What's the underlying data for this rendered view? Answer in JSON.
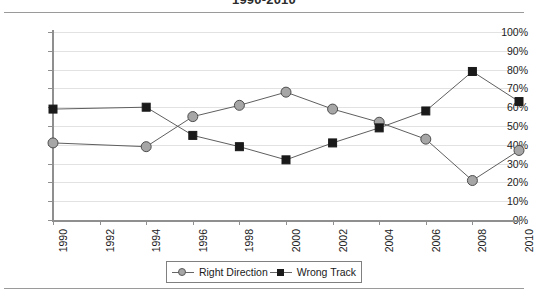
{
  "title": "1990-2010",
  "legend": {
    "position": "bottom-center",
    "entries": [
      {
        "label": "Right Direction",
        "marker": "circle-gray",
        "color": "#a6a6a6"
      },
      {
        "label": "Wrong Track",
        "marker": "square-black",
        "color": "#1a1a1a"
      }
    ]
  },
  "axes": {
    "y_ticks": [
      "0%",
      "10%",
      "20%",
      "30%",
      "40%",
      "50%",
      "60%",
      "70%",
      "80%",
      "90%",
      "100%"
    ],
    "x_ticks": [
      "1990",
      "1992",
      "1994",
      "1996",
      "1998",
      "2000",
      "2002",
      "2004",
      "2006",
      "2008",
      "2010"
    ]
  },
  "chart_data": {
    "type": "line",
    "title": "1990-2010",
    "xlabel": "",
    "ylabel": "",
    "ylim": [
      0,
      100
    ],
    "ytick_step": 10,
    "grid": true,
    "legend_position": "bottom-center",
    "x": [
      1990,
      1992,
      1994,
      1996,
      1998,
      2000,
      2002,
      2004,
      2006,
      2008,
      2010
    ],
    "categories": [
      "1990",
      "1992",
      "1994",
      "1996",
      "1998",
      "2000",
      "2002",
      "2004",
      "2006",
      "2008",
      "2010"
    ],
    "series": [
      {
        "name": "Right Direction",
        "color": "#a6a6a6",
        "marker": "circle",
        "x": [
          1990,
          1994,
          1996,
          1998,
          2000,
          2002,
          2004,
          2006,
          2008,
          2010
        ],
        "values": [
          41,
          39,
          55,
          61,
          68,
          59,
          52,
          43,
          21,
          37
        ]
      },
      {
        "name": "Wrong Track",
        "color": "#1a1a1a",
        "marker": "square",
        "x": [
          1990,
          1994,
          1996,
          1998,
          2000,
          2002,
          2004,
          2006,
          2008,
          2010
        ],
        "values": [
          59,
          60,
          45,
          39,
          32,
          41,
          49,
          58,
          79,
          63
        ]
      }
    ]
  }
}
